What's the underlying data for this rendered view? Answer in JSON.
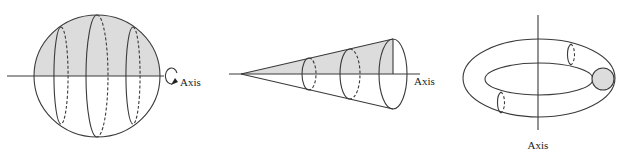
{
  "figures": [
    {
      "id": "sphere",
      "description": "Semicircle (shaded upper half) revolved about horizontal axis forming a sphere",
      "axis_label": "Axis",
      "axis_orientation": "horizontal",
      "shaded_region": "upper half disk"
    },
    {
      "id": "cone",
      "description": "Right triangle (shaded) revolved about horizontal axis forming a cone",
      "axis_label": "Axis",
      "axis_orientation": "horizontal",
      "shaded_region": "triangle"
    },
    {
      "id": "torus",
      "description": "Disk (shaded circle) revolved about vertical axis forming a torus",
      "axis_label": "Axis",
      "axis_orientation": "vertical",
      "shaded_region": "circle"
    }
  ],
  "colors": {
    "stroke": "#3a3a3a",
    "shade": "#dcdcdc",
    "background": "#ffffff"
  }
}
